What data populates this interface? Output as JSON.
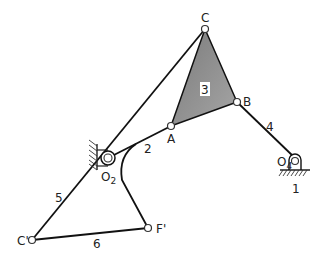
{
  "diagram": {
    "type": "planar linkage mechanism",
    "joints": {
      "C": {
        "label": "C",
        "x": 205,
        "y": 29
      },
      "B": {
        "label": "B",
        "x": 237,
        "y": 102
      },
      "A": {
        "label": "A",
        "x": 171,
        "y": 126
      },
      "O2": {
        "label": "O",
        "sub": "2",
        "x": 108,
        "y": 158
      },
      "O4": {
        "label": "O",
        "sub": "4",
        "x": 295,
        "y": 162
      },
      "Cp": {
        "label": "C'",
        "x": 32,
        "y": 240
      },
      "Fp": {
        "label": "F'",
        "x": 148,
        "y": 228
      }
    },
    "links": {
      "l1": "1",
      "l2": "2",
      "l3": "3",
      "l4": "4",
      "l5": "5",
      "l6": "6"
    },
    "colors": {
      "line": "#111111",
      "triangle_fill": "#8c8c8c",
      "ground_hatch": "#333333"
    }
  }
}
